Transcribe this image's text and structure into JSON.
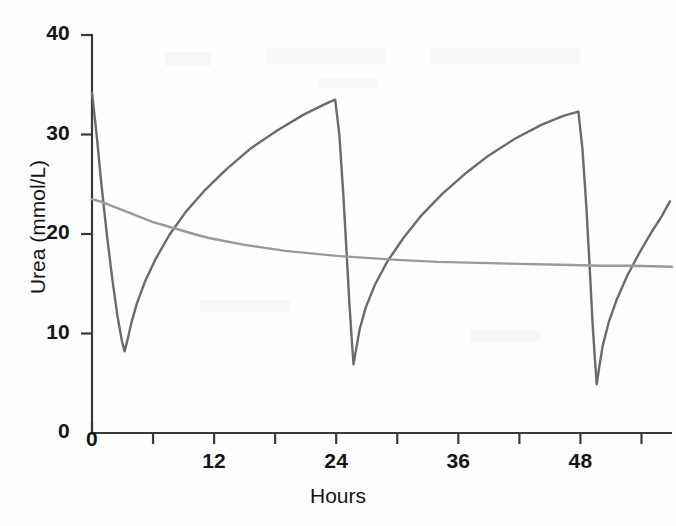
{
  "chart_data": {
    "type": "line",
    "title": "",
    "xlabel": "Hours",
    "ylabel": "Urea (mmol/L)",
    "xlim": [
      0,
      57
    ],
    "ylim": [
      0,
      40
    ],
    "grid": false,
    "legend": null,
    "x_ticks": [
      0,
      6,
      12,
      18,
      24,
      30,
      36,
      42,
      48,
      54
    ],
    "x_tick_labels": [
      "0",
      "",
      "12",
      "",
      "24",
      "",
      "36",
      "",
      "48",
      ""
    ],
    "y_ticks": [
      0,
      10,
      20,
      30,
      40
    ],
    "y_tick_labels": [
      "0",
      "10",
      "20",
      "30",
      "40"
    ],
    "series": [
      {
        "name": "intermittent-haemodialysis",
        "color": "#6b6b6b",
        "description": "Sawtooth urea profile: sharp fall during each dialysis session, rebound and rise between sessions",
        "points": [
          [
            0.0,
            34.2
          ],
          [
            0.45,
            30.0
          ],
          [
            0.9,
            25.2
          ],
          [
            1.45,
            20.0
          ],
          [
            2.0,
            15.4
          ],
          [
            2.5,
            11.8
          ],
          [
            2.95,
            9.2
          ],
          [
            3.2,
            8.2
          ],
          [
            3.5,
            9.4
          ],
          [
            3.9,
            11.2
          ],
          [
            4.4,
            13.0
          ],
          [
            5.2,
            15.2
          ],
          [
            6.2,
            17.4
          ],
          [
            7.6,
            19.9
          ],
          [
            9.2,
            22.2
          ],
          [
            11.0,
            24.3
          ],
          [
            13.2,
            26.5
          ],
          [
            15.6,
            28.6
          ],
          [
            18.2,
            30.4
          ],
          [
            20.8,
            32.0
          ],
          [
            23.0,
            33.1
          ],
          [
            23.9,
            33.5
          ],
          [
            24.3,
            30.0
          ],
          [
            24.7,
            24.0
          ],
          [
            25.0,
            18.5
          ],
          [
            25.3,
            13.0
          ],
          [
            25.55,
            9.0
          ],
          [
            25.7,
            6.9
          ],
          [
            25.95,
            8.4
          ],
          [
            26.3,
            10.4
          ],
          [
            26.9,
            12.6
          ],
          [
            27.8,
            14.9
          ],
          [
            29.0,
            17.2
          ],
          [
            30.6,
            19.6
          ],
          [
            32.4,
            21.9
          ],
          [
            34.4,
            24.0
          ],
          [
            36.6,
            26.0
          ],
          [
            39.0,
            27.9
          ],
          [
            41.6,
            29.6
          ],
          [
            44.2,
            31.0
          ],
          [
            46.4,
            31.9
          ],
          [
            47.8,
            32.3
          ],
          [
            48.2,
            28.5
          ],
          [
            48.6,
            22.5
          ],
          [
            48.9,
            16.8
          ],
          [
            49.2,
            11.0
          ],
          [
            49.45,
            7.0
          ],
          [
            49.6,
            4.9
          ],
          [
            49.85,
            6.6
          ],
          [
            50.2,
            8.8
          ],
          [
            50.8,
            11.2
          ],
          [
            51.6,
            13.5
          ],
          [
            52.6,
            15.8
          ],
          [
            53.8,
            18.1
          ],
          [
            55.0,
            20.2
          ],
          [
            56.0,
            21.8
          ],
          [
            56.8,
            23.3
          ]
        ]
      },
      {
        "name": "continuous-renal-replacement",
        "color": "#9a9a9a",
        "description": "Smooth monotonic exponential decay to a steady plateau",
        "points": [
          [
            0.0,
            23.5
          ],
          [
            1.0,
            23.2
          ],
          [
            2.0,
            22.8
          ],
          [
            3.0,
            22.4
          ],
          [
            4.0,
            22.0
          ],
          [
            5.0,
            21.6
          ],
          [
            6.0,
            21.2
          ],
          [
            7.0,
            20.9
          ],
          [
            8.0,
            20.6
          ],
          [
            9.0,
            20.3
          ],
          [
            10.0,
            20.0
          ],
          [
            11.5,
            19.6
          ],
          [
            13.0,
            19.3
          ],
          [
            15.0,
            18.9
          ],
          [
            17.0,
            18.6
          ],
          [
            19.0,
            18.3
          ],
          [
            21.0,
            18.1
          ],
          [
            24.0,
            17.8
          ],
          [
            27.0,
            17.6
          ],
          [
            30.0,
            17.4
          ],
          [
            34.0,
            17.2
          ],
          [
            38.0,
            17.1
          ],
          [
            42.0,
            17.0
          ],
          [
            46.0,
            16.9
          ],
          [
            50.0,
            16.8
          ],
          [
            53.0,
            16.8
          ],
          [
            57.0,
            16.7
          ]
        ]
      }
    ]
  },
  "axes": {
    "x_axis_name": "hours-axis",
    "y_axis_name": "urea-axis",
    "axis_color": "#3a3a3a"
  }
}
